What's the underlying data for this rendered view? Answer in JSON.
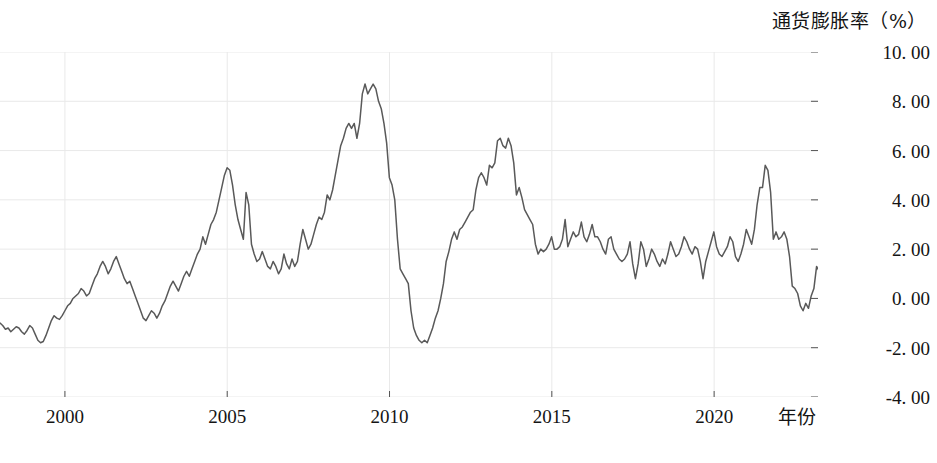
{
  "chart_data": {
    "type": "line",
    "title": "",
    "ylabel": "通货膨胀率（%）",
    "xlabel": "年份",
    "ylim": [
      -4.0,
      10.0
    ],
    "xlim": [
      1998.0,
      2023.2
    ],
    "grid": true,
    "legend": null,
    "line_color": "#595959",
    "grid_color": "#e9e9e9",
    "y_ticks": [
      {
        "value": 10.0,
        "label": "10. 00"
      },
      {
        "value": 8.0,
        "label": "8. 00"
      },
      {
        "value": 6.0,
        "label": "6. 00"
      },
      {
        "value": 4.0,
        "label": "4. 00"
      },
      {
        "value": 2.0,
        "label": "2. 00"
      },
      {
        "value": 0.0,
        "label": "0. 00"
      },
      {
        "value": -2.0,
        "label": "-2. 00"
      },
      {
        "value": -4.0,
        "label": "-4. 00"
      }
    ],
    "x_ticks": [
      {
        "value": 2000,
        "label": "2000"
      },
      {
        "value": 2005,
        "label": "2005"
      },
      {
        "value": 2010,
        "label": "2010"
      },
      {
        "value": 2015,
        "label": "2015"
      },
      {
        "value": 2020,
        "label": "2020"
      }
    ],
    "series": [
      {
        "name": "通货膨胀率",
        "x_start": 1998.0,
        "x_step": 0.0833,
        "values": [
          -1.0,
          -1.1,
          -1.25,
          -1.2,
          -1.35,
          -1.25,
          -1.15,
          -1.2,
          -1.35,
          -1.45,
          -1.3,
          -1.1,
          -1.2,
          -1.45,
          -1.7,
          -1.8,
          -1.75,
          -1.5,
          -1.2,
          -0.9,
          -0.7,
          -0.8,
          -0.85,
          -0.7,
          -0.5,
          -0.3,
          -0.2,
          0.0,
          0.1,
          0.2,
          0.4,
          0.3,
          0.1,
          0.2,
          0.5,
          0.8,
          1.0,
          1.3,
          1.5,
          1.3,
          1.0,
          1.2,
          1.5,
          1.7,
          1.4,
          1.1,
          0.8,
          0.6,
          0.7,
          0.4,
          0.1,
          -0.2,
          -0.5,
          -0.8,
          -0.9,
          -0.7,
          -0.5,
          -0.6,
          -0.8,
          -0.6,
          -0.3,
          -0.1,
          0.2,
          0.5,
          0.7,
          0.5,
          0.3,
          0.6,
          0.9,
          1.1,
          0.9,
          1.2,
          1.5,
          1.8,
          2.0,
          2.5,
          2.2,
          2.6,
          3.0,
          3.2,
          3.5,
          4.0,
          4.5,
          5.0,
          5.3,
          5.2,
          4.6,
          3.8,
          3.2,
          2.8,
          2.4,
          4.3,
          3.8,
          2.2,
          1.8,
          1.5,
          1.6,
          1.9,
          1.6,
          1.3,
          1.2,
          1.5,
          1.3,
          1.0,
          1.2,
          1.8,
          1.4,
          1.2,
          1.6,
          1.3,
          1.5,
          2.2,
          2.8,
          2.4,
          2.0,
          2.2,
          2.6,
          3.0,
          3.3,
          3.2,
          3.5,
          4.2,
          4.0,
          4.4,
          5.0,
          5.6,
          6.2,
          6.5,
          6.9,
          7.1,
          6.9,
          7.1,
          6.5,
          7.1,
          8.3,
          8.7,
          8.3,
          8.5,
          8.7,
          8.5,
          8.0,
          7.7,
          7.1,
          6.3,
          4.9,
          4.6,
          4.0,
          2.4,
          1.2,
          1.0,
          0.8,
          0.6,
          -0.5,
          -1.2,
          -1.5,
          -1.7,
          -1.8,
          -1.7,
          -1.8,
          -1.5,
          -1.2,
          -0.8,
          -0.5,
          0.0,
          0.6,
          1.5,
          1.9,
          2.4,
          2.7,
          2.4,
          2.8,
          2.9,
          3.1,
          3.3,
          3.5,
          3.6,
          4.4,
          4.9,
          5.1,
          4.9,
          4.6,
          5.4,
          5.3,
          5.5,
          6.4,
          6.5,
          6.2,
          6.1,
          6.5,
          6.2,
          5.5,
          4.2,
          4.5,
          4.1,
          3.6,
          3.4,
          3.2,
          3.0,
          2.2,
          1.8,
          2.0,
          1.9,
          2.0,
          2.2,
          2.5,
          2.0,
          2.0,
          2.1,
          2.4,
          3.2,
          2.1,
          2.4,
          2.7,
          2.5,
          2.6,
          3.1,
          2.5,
          2.3,
          2.6,
          3.0,
          2.5,
          2.5,
          2.3,
          2.0,
          1.8,
          2.4,
          2.5,
          2.0,
          1.8,
          1.6,
          1.5,
          1.6,
          1.8,
          2.3,
          1.4,
          0.8,
          1.4,
          2.3,
          2.0,
          1.3,
          1.6,
          2.0,
          1.8,
          1.5,
          1.3,
          1.6,
          1.4,
          1.8,
          2.3,
          2.0,
          1.7,
          1.8,
          2.1,
          2.5,
          2.3,
          2.0,
          1.8,
          2.1,
          2.0,
          1.5,
          0.8,
          1.5,
          1.9,
          2.3,
          2.7,
          2.1,
          1.8,
          1.7,
          1.9,
          2.1,
          2.5,
          2.3,
          1.7,
          1.5,
          1.8,
          2.2,
          2.8,
          2.5,
          2.2,
          2.8,
          3.8,
          4.5,
          4.5,
          5.4,
          5.2,
          4.3,
          2.4,
          2.7,
          2.4,
          2.5,
          2.7,
          2.4,
          1.7,
          0.5,
          0.4,
          0.2,
          -0.3,
          -0.5,
          -0.2,
          -0.4,
          0.1,
          0.4,
          1.3,
          1.1,
          0.9,
          0.4,
          0.8,
          1.5,
          2.1,
          1.8,
          1.5,
          1.3,
          1.8,
          2.5,
          2.7,
          2.5,
          2.1,
          2.8,
          2.7,
          2.2,
          1.8,
          2.1,
          2.8,
          3.0,
          2.5,
          2.1,
          1.6,
          0.8
        ]
      }
    ]
  }
}
